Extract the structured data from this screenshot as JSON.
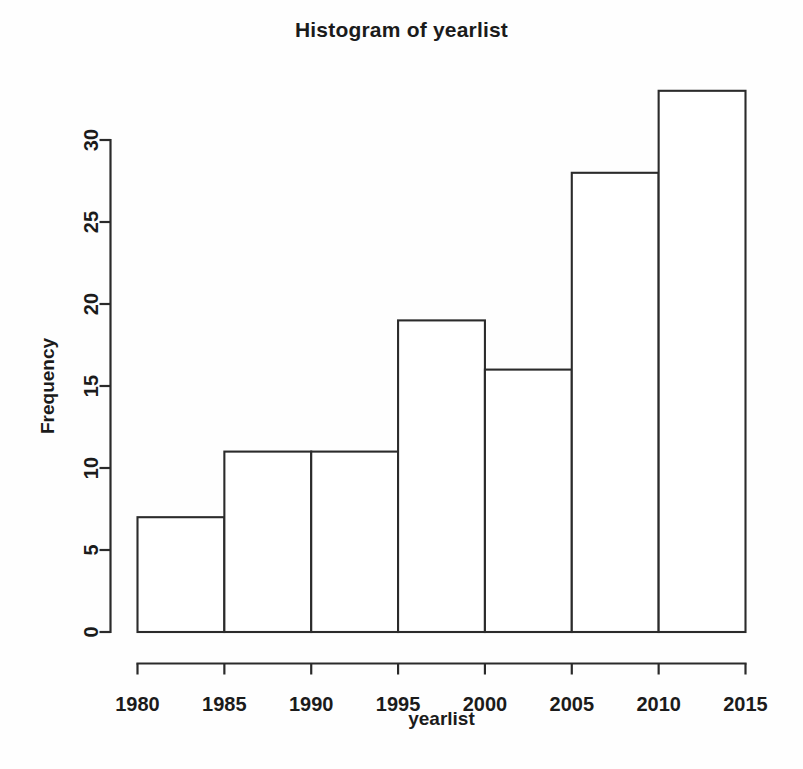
{
  "chart_data": {
    "type": "bar",
    "title": "Histogram of yearlist",
    "xlabel": "yearlist",
    "ylabel": "Frequency",
    "categories": [
      "1980-1985",
      "1985-1990",
      "1990-1995",
      "1995-2000",
      "2000-2005",
      "2005-2010",
      "2010-2015"
    ],
    "bin_edges": [
      1980,
      1985,
      1990,
      1995,
      2000,
      2005,
      2010,
      2015
    ],
    "values": [
      7,
      11,
      11,
      19,
      16,
      28,
      33
    ],
    "xlim": [
      1980,
      2015
    ],
    "ylim": [
      0,
      33
    ],
    "x_ticks": [
      1980,
      1985,
      1990,
      1995,
      2000,
      2005,
      2010,
      2015
    ],
    "y_ticks": [
      0,
      5,
      10,
      15,
      20,
      25,
      30
    ],
    "x_tick_labels": [
      "1980",
      "1985",
      "1990",
      "1995",
      "2000",
      "2005",
      "2010",
      "2015"
    ],
    "y_tick_labels": [
      "0",
      "5",
      "10",
      "15",
      "20",
      "25",
      "30"
    ],
    "grid": false,
    "legend": false,
    "bar_fill": "#ffffff",
    "bar_stroke": "#2b2b2b",
    "background": "#fefefe"
  },
  "figure": {
    "title": "Histogram of yearlist",
    "x_axis_title": "yearlist",
    "y_axis_title": "Frequency"
  }
}
